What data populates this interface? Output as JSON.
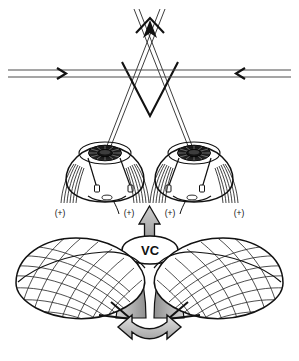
{
  "figure": {
    "background_color": "#ffffff",
    "ink_color": "#1a1a1a",
    "shade_color": "#b9b9b9",
    "width": 299,
    "height": 361
  },
  "target_plane": {
    "name": "horizontal-target-plane",
    "left_arrowhead": ">",
    "right_arrowhead": "<",
    "line_count": 2
  },
  "sight_lines": {
    "name": "crossed-visual-axes",
    "crossing_point_label": "",
    "apex_arrow": "up"
  },
  "eyes": [
    {
      "side": "left",
      "name": "left-eye",
      "iris": "dark",
      "pupil": "light"
    },
    {
      "side": "right",
      "name": "right-eye",
      "iris": "dark",
      "pupil": "light"
    }
  ],
  "muscle_labels": [
    {
      "text": "(+)",
      "position": "left-lateral"
    },
    {
      "text": "(+)",
      "position": "left-medial"
    },
    {
      "text": "(+)",
      "position": "right-medial"
    },
    {
      "text": "(+)",
      "position": "right-lateral"
    }
  ],
  "vergence_center": {
    "name": "vergence-center-node",
    "label": "VC",
    "output_arrow_direction": "up",
    "input_arrow_direction": "bidirectional-curved"
  },
  "hemispheres": [
    {
      "side": "left",
      "name": "left-cerebellar-hemisphere",
      "style": "wireframe-mesh"
    },
    {
      "side": "right",
      "name": "right-cerebellar-hemisphere",
      "style": "wireframe-mesh"
    }
  ],
  "bottom_arrow": {
    "name": "interhemispheric-bidirectional-arrow",
    "style": "hollow-curved-double-headed"
  }
}
